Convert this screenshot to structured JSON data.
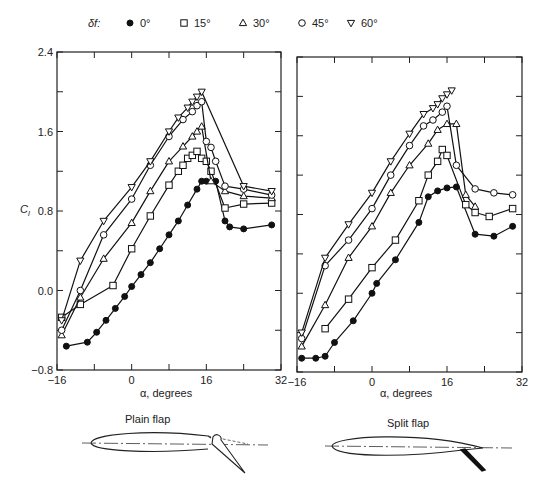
{
  "legend": {
    "symbol_label": "δf:",
    "entries": [
      {
        "label": "0°",
        "marker": "filled-circle"
      },
      {
        "label": "15°",
        "marker": "open-square"
      },
      {
        "label": "30°",
        "marker": "open-triangle-up"
      },
      {
        "label": "45°",
        "marker": "open-circle"
      },
      {
        "label": "60°",
        "marker": "open-triangle-down"
      }
    ]
  },
  "panels": [
    {
      "title": "Plain flap",
      "xlabel": "α, degrees",
      "ylabel": "Cl"
    },
    {
      "title": "Split flap",
      "xlabel": "α, degrees",
      "ylabel": ""
    }
  ],
  "axes": {
    "xticks": [
      "-16",
      "0",
      "16",
      "32"
    ],
    "yticks": [
      "2.4",
      "1.6",
      "0.8",
      "0.0",
      "-0.8"
    ]
  },
  "chart_data": [
    {
      "type": "line",
      "title": "Plain flap",
      "xlabel": "α, degrees",
      "ylabel": "Cl",
      "xlim": [
        -16,
        32
      ],
      "ylim": [
        -0.8,
        2.4
      ],
      "xticks": [
        -16,
        0,
        16,
        32
      ],
      "yticks": [
        -0.8,
        0.0,
        0.8,
        1.6,
        2.4
      ],
      "grid": false,
      "legend_position": "top",
      "series": [
        {
          "name": "0°",
          "marker": "filled-circle",
          "x": [
            -14,
            -9.5,
            -7.5,
            -5.5,
            -3.5,
            -1.5,
            0,
            2,
            4,
            6,
            8,
            10,
            12,
            14,
            15,
            16,
            18,
            20,
            21,
            24,
            30
          ],
          "y": [
            -0.56,
            -0.52,
            -0.42,
            -0.3,
            -0.18,
            -0.06,
            0.04,
            0.16,
            0.28,
            0.42,
            0.56,
            0.7,
            0.86,
            1.02,
            1.1,
            1.1,
            1.1,
            0.7,
            0.64,
            0.62,
            0.66
          ]
        },
        {
          "name": "15°",
          "marker": "open-square",
          "x": [
            -15,
            -11,
            -4,
            0,
            4,
            8,
            10,
            11,
            12,
            13,
            14,
            15,
            16,
            17,
            20,
            24,
            30
          ],
          "y": [
            -0.27,
            -0.14,
            0.05,
            0.42,
            0.75,
            1.06,
            1.2,
            1.26,
            1.33,
            1.36,
            1.4,
            1.33,
            1.3,
            1.2,
            0.83,
            0.87,
            0.88
          ]
        },
        {
          "name": "30°",
          "marker": "open-triangle-up",
          "x": [
            -15,
            -11,
            -6,
            0,
            4,
            8,
            11,
            13,
            14,
            15,
            17,
            20,
            24,
            30
          ],
          "y": [
            -0.45,
            -0.07,
            0.32,
            0.68,
            1.0,
            1.3,
            1.45,
            1.55,
            1.6,
            1.65,
            1.1,
            1.0,
            0.95,
            0.93
          ]
        },
        {
          "name": "45°",
          "marker": "open-circle",
          "x": [
            -15,
            -11,
            -6,
            0,
            4,
            8,
            11,
            13,
            14,
            15,
            16,
            17,
            18,
            20,
            24,
            30
          ],
          "y": [
            -0.4,
            0.0,
            0.56,
            0.92,
            1.26,
            1.55,
            1.72,
            1.8,
            1.86,
            1.9,
            1.5,
            1.44,
            1.3,
            1.05,
            1.02,
            0.96
          ]
        },
        {
          "name": "60°",
          "marker": "open-triangle-down",
          "x": [
            -15,
            -11,
            -6,
            0,
            4,
            8,
            10,
            12,
            13,
            14,
            15,
            24,
            30
          ],
          "y": [
            -0.3,
            0.3,
            0.7,
            1.04,
            1.3,
            1.6,
            1.74,
            1.84,
            1.9,
            1.95,
            2.0,
            1.05,
            1.0
          ]
        }
      ]
    },
    {
      "type": "line",
      "title": "Split flap",
      "xlabel": "α, degrees",
      "ylabel": "Cl",
      "xlim": [
        -16,
        32
      ],
      "ylim": [
        -0.8,
        2.4
      ],
      "xticks": [
        -16,
        0,
        16,
        32
      ],
      "yticks": [
        -0.8,
        0.0,
        0.8,
        1.6,
        2.4
      ],
      "grid": false,
      "legend_position": "top",
      "series": [
        {
          "name": "0°",
          "marker": "filled-circle",
          "x": [
            -15,
            -12,
            -10,
            -8,
            -4,
            0,
            1,
            5,
            10,
            12,
            14,
            16,
            18,
            22,
            26,
            30
          ],
          "y": [
            -0.66,
            -0.66,
            -0.64,
            -0.5,
            -0.28,
            0.0,
            0.1,
            0.34,
            0.72,
            0.98,
            1.04,
            1.07,
            1.08,
            0.6,
            0.58,
            0.68
          ]
        },
        {
          "name": "15°",
          "marker": "open-square",
          "x": [
            -10,
            -5,
            0,
            5,
            10,
            12,
            14,
            15,
            16,
            20,
            22,
            25,
            30
          ],
          "y": [
            -0.36,
            -0.06,
            0.26,
            0.54,
            0.94,
            1.2,
            1.34,
            1.46,
            1.4,
            0.9,
            0.82,
            0.78,
            0.86
          ]
        },
        {
          "name": "30°",
          "marker": "open-triangle-up",
          "x": [
            -15,
            -10,
            -5,
            0,
            4,
            8,
            12,
            14,
            16,
            18,
            20,
            22
          ],
          "y": [
            -0.54,
            -0.12,
            0.36,
            0.68,
            1.02,
            1.3,
            1.52,
            1.66,
            1.72,
            1.72,
            1.0,
            0.88
          ]
        },
        {
          "name": "45°",
          "marker": "open-circle",
          "x": [
            -15,
            -10,
            -5,
            0,
            4,
            8,
            11,
            13,
            15,
            16,
            18,
            22,
            26,
            30
          ],
          "y": [
            -0.46,
            0.28,
            0.54,
            0.86,
            1.2,
            1.5,
            1.7,
            1.76,
            1.84,
            1.9,
            1.3,
            1.06,
            1.02,
            1.0
          ]
        },
        {
          "name": "60°",
          "marker": "open-triangle-down",
          "x": [
            -15,
            -10,
            -5,
            0,
            4,
            8,
            11,
            13,
            14,
            15,
            16,
            17
          ],
          "y": [
            -0.4,
            0.36,
            0.7,
            1.02,
            1.34,
            1.62,
            1.82,
            1.88,
            1.92,
            1.98,
            2.02,
            2.06
          ]
        }
      ]
    }
  ],
  "sketches": {
    "plain_flap_label": "Plain flap",
    "split_flap_label": "Split flap"
  }
}
